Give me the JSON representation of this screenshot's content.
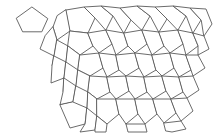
{
  "figure": {
    "background_color": "#ffffff",
    "stroke_color": "#5a5a5a",
    "stroke_width": 0.9,
    "canvas": {
      "width": 219,
      "height": 139
    }
  },
  "prototile": {
    "label": "prototile-pentagon",
    "description": "Single reference pentagon drawn apart from the tiling, upper-left",
    "sides": 5,
    "bounds": {
      "x": 16,
      "y": 7,
      "width": 32,
      "height": 25
    },
    "points": "32.2,7.2 47.8,18.6 41.8,31.8 22.6,31.8 16.4,18.6"
  },
  "tiling": {
    "label": "cairo-pentagonal-tiling",
    "type": "pentagonal",
    "bounds": {
      "x": 52,
      "y": 6,
      "width": 160,
      "height": 127
    },
    "tile_count": 46,
    "tiles": [
      {
        "id": "t-0-0",
        "points": "66,10 84,7 95,18 88,33 70,31"
      },
      {
        "id": "t-0-1",
        "points": "95,18 84,7 101,6 113,16 106,30"
      },
      {
        "id": "t-0-2",
        "points": "113,16 101,6 120,8 131,20 124,33"
      },
      {
        "id": "t-0-3",
        "points": "131,20 120,8 137,6 150,16 142,30"
      },
      {
        "id": "t-0-4",
        "points": "150,16 137,6 155,7 167,19 159,32"
      },
      {
        "id": "t-0-5",
        "points": "167,19 155,7 173,6 186,16 178,30"
      },
      {
        "id": "t-0-6",
        "points": "186,16 173,6 190,8 201,20 193,33"
      },
      {
        "id": "t-0-7",
        "points": "201,20 190,8 206,9 212,24 204,36"
      },
      {
        "id": "t-1-0",
        "points": "66,10 70,31 57,40 53,27 57,16"
      },
      {
        "id": "t-1-1",
        "points": "70,31 88,33 93,46 80,55 68,46"
      },
      {
        "id": "t-1-2",
        "points": "88,33 106,30 112,44 99,53 93,46"
      },
      {
        "id": "t-1-3",
        "points": "106,30 124,33 128,46 116,55 112,44"
      },
      {
        "id": "t-1-4",
        "points": "124,33 142,30 147,44 135,53 128,46"
      },
      {
        "id": "t-1-5",
        "points": "142,30 159,32 164,46 152,55 147,44"
      },
      {
        "id": "t-1-6",
        "points": "159,32 178,30 183,44 170,53 164,46"
      },
      {
        "id": "t-1-7",
        "points": "178,30 193,33 198,46 186,55 183,44"
      },
      {
        "id": "t-1-8",
        "points": "193,33 204,36 209,49 198,55 198,46"
      },
      {
        "id": "t-2-0",
        "points": "53,27 57,40 54,56 40,49 45,36"
      },
      {
        "id": "t-2-1",
        "points": "57,40 68,46 66,62 52,66 54,56"
      },
      {
        "id": "t-2-2",
        "points": "68,46 80,55 78,70 66,76 66,62"
      },
      {
        "id": "t-2-3",
        "points": "80,55 99,53 103,68 90,76 78,70"
      },
      {
        "id": "t-2-4",
        "points": "99,53 116,55 119,70 107,77 103,68"
      },
      {
        "id": "t-2-5",
        "points": "116,55 135,53 139,68 126,76 119,70"
      },
      {
        "id": "t-2-6",
        "points": "135,53 152,55 156,70 144,77 139,68"
      },
      {
        "id": "t-2-7",
        "points": "152,55 170,53 174,68 162,76 156,70"
      },
      {
        "id": "t-2-8",
        "points": "170,53 186,55 191,70 179,77 174,68"
      },
      {
        "id": "t-2-9",
        "points": "186,55 198,55 205,68 193,76 191,70"
      },
      {
        "id": "t-3-0",
        "points": "54,56 66,62 64,78 51,83 52,66"
      },
      {
        "id": "t-3-1",
        "points": "66,62 78,70 76,86 63,92 64,78"
      },
      {
        "id": "t-3-2",
        "points": "78,70 90,76 88,92 76,98 76,86"
      },
      {
        "id": "t-3-3",
        "points": "90,76 107,77 110,92 97,99 88,92"
      },
      {
        "id": "t-3-4",
        "points": "107,77 126,76 129,91 116,99 110,92"
      },
      {
        "id": "t-3-5",
        "points": "126,76 144,77 147,92 135,99 129,91"
      },
      {
        "id": "t-3-6",
        "points": "144,77 162,76 166,91 153,99 147,92"
      },
      {
        "id": "t-3-7",
        "points": "162,76 179,77 183,92 171,99 166,91"
      },
      {
        "id": "t-3-8",
        "points": "179,77 193,76 199,90 187,98 183,92"
      },
      {
        "id": "t-4-0",
        "points": "64,78 76,86 73,102 60,105 63,92"
      },
      {
        "id": "t-4-1",
        "points": "76,86 88,92 87,108 74,114 73,102"
      },
      {
        "id": "t-4-2",
        "points": "88,92 97,99 97,116 84,122 87,108"
      },
      {
        "id": "t-4-3",
        "points": "97,99 116,99 119,114 107,124 97,116"
      },
      {
        "id": "t-4-4",
        "points": "116,99 135,99 138,114 126,124 119,114"
      },
      {
        "id": "t-4-5",
        "points": "135,99 153,99 157,114 145,124 138,114"
      },
      {
        "id": "t-4-6",
        "points": "153,99 171,99 176,113 164,123 157,114"
      },
      {
        "id": "t-4-7",
        "points": "171,99 187,98 193,111 181,121 176,113"
      },
      {
        "id": "t-5-0",
        "points": "73,102 87,108 85,124 70,128 60,105"
      },
      {
        "id": "t-5-1",
        "points": "87,108 97,116 95,130 80,132 85,124"
      },
      {
        "id": "t-5-2",
        "points": "97,116 107,124 106,132 95,132 95,130"
      },
      {
        "id": "t-5-3",
        "points": "126,124 145,124 147,132 128,132 126,124"
      },
      {
        "id": "t-5-4",
        "points": "164,123 181,121 186,129 172,132 166,131"
      }
    ]
  }
}
